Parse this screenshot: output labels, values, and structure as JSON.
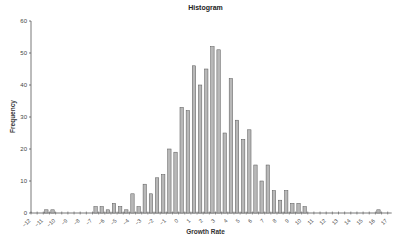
{
  "chart_data": {
    "type": "bar",
    "title": "Histogram",
    "xlabel": "Growth Rate",
    "ylabel": "Frequency",
    "xlim": [
      -12,
      17
    ],
    "ylim": [
      0,
      60
    ],
    "bin_width": 0.5,
    "x_ticks": [
      -12,
      -11,
      -10,
      -9,
      -8,
      -7,
      -6,
      -5,
      -4,
      -3,
      -2,
      -1,
      0,
      1,
      2,
      3,
      4,
      5,
      6,
      7,
      8,
      9,
      10,
      11,
      12,
      13,
      14,
      15,
      16,
      17
    ],
    "y_ticks": [
      0,
      10,
      20,
      30,
      40,
      50,
      60
    ],
    "grid": false,
    "legend": null,
    "bins": [
      {
        "start": -11.0,
        "value": 1
      },
      {
        "start": -10.5,
        "value": 1
      },
      {
        "start": -7.0,
        "value": 2
      },
      {
        "start": -6.5,
        "value": 2
      },
      {
        "start": -6.0,
        "value": 1
      },
      {
        "start": -5.5,
        "value": 3
      },
      {
        "start": -5.0,
        "value": 2
      },
      {
        "start": -4.5,
        "value": 1
      },
      {
        "start": -4.0,
        "value": 6
      },
      {
        "start": -3.5,
        "value": 2
      },
      {
        "start": -3.0,
        "value": 9
      },
      {
        "start": -2.5,
        "value": 6
      },
      {
        "start": -2.0,
        "value": 11
      },
      {
        "start": -1.5,
        "value": 12
      },
      {
        "start": -1.0,
        "value": 20
      },
      {
        "start": -0.5,
        "value": 19
      },
      {
        "start": 0.0,
        "value": 33
      },
      {
        "start": 0.5,
        "value": 32
      },
      {
        "start": 1.0,
        "value": 46
      },
      {
        "start": 1.5,
        "value": 40
      },
      {
        "start": 2.0,
        "value": 45
      },
      {
        "start": 2.5,
        "value": 52
      },
      {
        "start": 3.0,
        "value": 51
      },
      {
        "start": 3.5,
        "value": 25
      },
      {
        "start": 4.0,
        "value": 42
      },
      {
        "start": 4.5,
        "value": 29
      },
      {
        "start": 5.0,
        "value": 23
      },
      {
        "start": 5.5,
        "value": 26
      },
      {
        "start": 6.0,
        "value": 15
      },
      {
        "start": 6.5,
        "value": 10
      },
      {
        "start": 7.0,
        "value": 15
      },
      {
        "start": 7.5,
        "value": 7
      },
      {
        "start": 8.0,
        "value": 4
      },
      {
        "start": 8.5,
        "value": 7
      },
      {
        "start": 9.0,
        "value": 3
      },
      {
        "start": 9.5,
        "value": 3
      },
      {
        "start": 10.0,
        "value": 2
      },
      {
        "start": 16.0,
        "value": 1
      }
    ],
    "bar_color": "#b8b8b8",
    "bar_edge_color": "#555555"
  }
}
